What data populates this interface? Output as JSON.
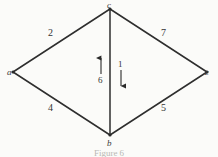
{
  "figure": {
    "caption": "Figure 6",
    "background_color": "#fbfbf9",
    "ink_color": "#2a2a2a"
  },
  "graph": {
    "vertices": [
      {
        "id": "a",
        "label": "a",
        "x": 12,
        "y": 72
      },
      {
        "id": "c",
        "label": "c",
        "x": 110,
        "y": 8
      },
      {
        "id": "b",
        "label": "b",
        "x": 110,
        "y": 135
      },
      {
        "id": "z",
        "label": "z",
        "x": 208,
        "y": 72
      }
    ],
    "edges": [
      {
        "id": "ac",
        "from": "a",
        "to": "c",
        "weight": "2"
      },
      {
        "id": "cz",
        "from": "c",
        "to": "z",
        "weight": "7"
      },
      {
        "id": "ab",
        "from": "a",
        "to": "b",
        "weight": "4"
      },
      {
        "id": "bz",
        "from": "b",
        "to": "z",
        "weight": "5"
      },
      {
        "id": "cb",
        "from": "c",
        "to": "b",
        "weight": ""
      }
    ],
    "flow_arrows": [
      {
        "id": "up-arrow",
        "label": "6",
        "direction": "up",
        "x": 101,
        "y_top": 57,
        "y_bottom": 74
      },
      {
        "id": "down-arrow",
        "label": "1",
        "direction": "down",
        "x": 121,
        "y_top": 70,
        "y_bottom": 87
      }
    ]
  }
}
